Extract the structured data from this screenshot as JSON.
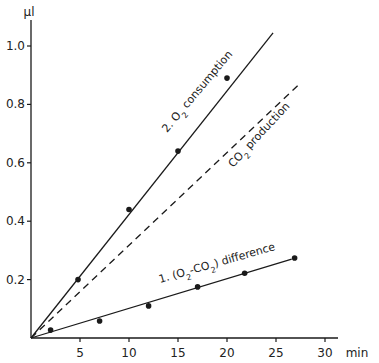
{
  "chart_data": {
    "type": "line",
    "title": "",
    "xlabel": "min",
    "ylabel": "µl",
    "xlim": [
      0,
      30
    ],
    "ylim": [
      0,
      1.0
    ],
    "grid": false,
    "legend": "inline labels along lines",
    "x_ticks": [
      5,
      10,
      15,
      20,
      25,
      30
    ],
    "x_tick_labels": [
      "5",
      "10",
      "15",
      "20",
      "25",
      "30"
    ],
    "y_ticks": [
      0.2,
      0.4,
      0.6,
      0.8,
      1.0
    ],
    "y_tick_labels": [
      "0.2",
      "0.4",
      "0.6",
      "0.8",
      "1.0"
    ],
    "series": [
      {
        "name": "2. O2 consumption",
        "label_parts": [
          "2. O",
          "2",
          " consumption"
        ],
        "style": "solid",
        "fit_line": {
          "x0": 0,
          "y0": 0,
          "x1": 24.7,
          "y1": 1.045
        },
        "points": [
          {
            "x": 4.8,
            "y": 0.2
          },
          {
            "x": 10.0,
            "y": 0.44
          },
          {
            "x": 15.0,
            "y": 0.64
          },
          {
            "x": 20.0,
            "y": 0.89
          }
        ]
      },
      {
        "name": "CO2 production",
        "label_parts": [
          "CO",
          "2",
          " production"
        ],
        "style": "dashed",
        "fit_line": {
          "x0": 0,
          "y0": 0,
          "x1": 27.4,
          "y1": 0.87
        },
        "points": []
      },
      {
        "name": "1. (O2-CO2) difference",
        "label_parts": [
          "1. (O",
          "2",
          "-CO",
          "2",
          ") difference"
        ],
        "style": "solid",
        "fit_line": {
          "x0": 0,
          "y0": 0,
          "x1": 26.6,
          "y1": 0.27
        },
        "points": [
          {
            "x": 2.0,
            "y": 0.027
          },
          {
            "x": 7.0,
            "y": 0.058
          },
          {
            "x": 12.0,
            "y": 0.11
          },
          {
            "x": 17.0,
            "y": 0.175
          },
          {
            "x": 21.8,
            "y": 0.222
          },
          {
            "x": 26.9,
            "y": 0.274
          }
        ]
      }
    ]
  },
  "colors": {
    "line": "#1a1a1a",
    "text": "#222222",
    "background": "#ffffff"
  }
}
